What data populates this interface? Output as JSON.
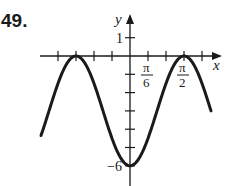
{
  "problem": {
    "number": "49."
  },
  "chart_data": {
    "type": "line",
    "title": "",
    "xlabel": "x",
    "ylabel": "y",
    "function": "y = -3 - 3cos(4x)",
    "amplitude": 3,
    "period": "π/2",
    "xlim": [
      "-5π/12",
      "7π/12"
    ],
    "ylim": [
      -6.5,
      1.5
    ],
    "x_tick_spacing": "π/12",
    "x_tick_labels": [
      {
        "value": "π/6",
        "num": "π",
        "den": "6"
      },
      {
        "value": "π/2",
        "num": "π",
        "den": "2"
      }
    ],
    "y_tick_labels": [
      {
        "value": 1,
        "label": "1"
      },
      {
        "value": -6,
        "label": "−6"
      }
    ],
    "maxima": [
      {
        "x": "-3π/4",
        "y": 0
      },
      {
        "x": "-π/4",
        "y": 0
      },
      {
        "x": "π/4",
        "y": 0
      }
    ],
    "minima": [
      {
        "x": "-π/2",
        "y": -6
      },
      {
        "x": "0",
        "y": -6
      },
      {
        "x": "π/2",
        "y": -6
      }
    ],
    "grid": false,
    "legend": null,
    "color": "#1a1a1a"
  }
}
